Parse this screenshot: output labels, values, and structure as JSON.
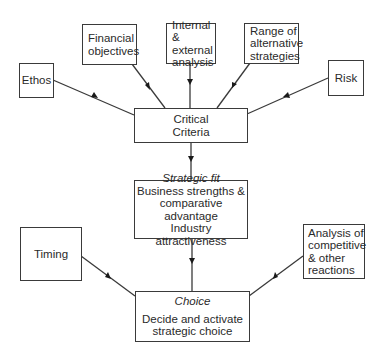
{
  "diagram": {
    "inputs_top": {
      "ethos": {
        "lines": [
          "Ethos"
        ]
      },
      "financial": {
        "lines": [
          "Financial",
          "objectives"
        ]
      },
      "analysis": {
        "lines": [
          "Internal &",
          "external",
          "analysis"
        ]
      },
      "range": {
        "lines": [
          "Range of",
          "alternative",
          "strategies"
        ]
      },
      "risk": {
        "lines": [
          "Risk"
        ]
      }
    },
    "critical": {
      "lines": [
        "Critical",
        "Criteria"
      ]
    },
    "strategic_fit": {
      "heading": "Strategic fit",
      "lines": [
        "Business strengths &",
        "comparative advantage"
      ],
      "extra": "Industry attractiveness"
    },
    "inputs_bottom": {
      "timing": {
        "lines": [
          "Timing"
        ]
      },
      "competitive": {
        "lines": [
          "Analysis of",
          "competitive",
          "& other",
          "reactions"
        ]
      }
    },
    "choice": {
      "heading": "Choice",
      "lines": [
        "Decide and activate",
        "strategic choice"
      ]
    },
    "edges": [
      {
        "from": "Ethos",
        "to": "Critical Criteria"
      },
      {
        "from": "Financial objectives",
        "to": "Critical Criteria"
      },
      {
        "from": "Internal & external analysis",
        "to": "Critical Criteria"
      },
      {
        "from": "Range of alternative strategies",
        "to": "Critical Criteria"
      },
      {
        "from": "Risk",
        "to": "Critical Criteria"
      },
      {
        "from": "Critical Criteria",
        "to": "Strategic fit"
      },
      {
        "from": "Strategic fit",
        "to": "Choice"
      },
      {
        "from": "Timing",
        "to": "Choice"
      },
      {
        "from": "Analysis of competitive & other reactions",
        "to": "Choice"
      }
    ],
    "colors": {
      "line": "#3a3a3a",
      "text": "#2a2a2a",
      "background": "#ffffff"
    }
  }
}
